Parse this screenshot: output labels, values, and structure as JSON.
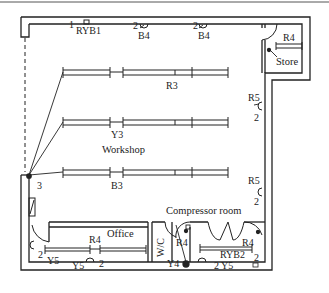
{
  "diagram": {
    "type": "electrical-floor-plan",
    "rooms": {
      "workshop": "Workshop",
      "store": "Store",
      "office": "Office",
      "compressor_room": "Compressor room",
      "wc": "W/C"
    },
    "circuits": {
      "ryb1": "RYB1",
      "ryb2": "RYB2",
      "r3": "R3",
      "y3": "Y3",
      "b3": "B3",
      "r4_store": "R4",
      "r4_office": "R4",
      "r4_wc": "R4",
      "r4_comp": "R4",
      "b4_a": "B4",
      "b4_b": "B4",
      "r5_a": "R5",
      "r5_b": "R5",
      "y4": "Y4",
      "y5_a": "Y5",
      "y5_b": "Y5",
      "y5_c": "Y5"
    },
    "numbers": {
      "n1": "1",
      "n2_b4a": "2",
      "n2_b4b": "2",
      "n2_r5a": "2",
      "n2_r5b": "2",
      "n2_office_a": "2",
      "n2_office_b": "2",
      "n2_comp_a": "2",
      "n2_comp_b": "2",
      "n3": "3"
    },
    "colors": {
      "line": "#222222",
      "background": "#ffffff"
    }
  }
}
